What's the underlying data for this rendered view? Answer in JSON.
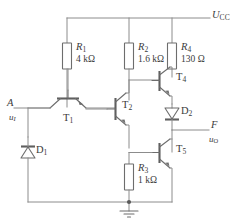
{
  "diagram": {
    "type": "schematic"
  },
  "supply": {
    "label_main": "U",
    "label_sub": "CC"
  },
  "ground": {
    "name": "ground-symbol"
  },
  "resistors": [
    {
      "id": "R1",
      "name": "R",
      "sub": "1",
      "value": "4 kΩ"
    },
    {
      "id": "R2",
      "name": "R",
      "sub": "2",
      "value": "1.6 kΩ"
    },
    {
      "id": "R4",
      "name": "R",
      "sub": "4",
      "value": "130 Ω"
    },
    {
      "id": "R3",
      "name": "R",
      "sub": "3",
      "value": "1 kΩ"
    }
  ],
  "transistors": [
    {
      "id": "T1",
      "name": "T",
      "sub": "1"
    },
    {
      "id": "T2",
      "name": "T",
      "sub": "2"
    },
    {
      "id": "T4",
      "name": "T",
      "sub": "4"
    },
    {
      "id": "T5",
      "name": "T",
      "sub": "5"
    }
  ],
  "diodes": [
    {
      "id": "D1",
      "name": "D",
      "sub": "1"
    },
    {
      "id": "D2",
      "name": "D",
      "sub": "2"
    }
  ],
  "terminals": {
    "input": {
      "node": "A",
      "signal_main": "u",
      "signal_sub": "I"
    },
    "output": {
      "node": "F",
      "signal_main": "u",
      "signal_sub": "O"
    }
  },
  "colors": {
    "wire": "#8c8c8c",
    "device": "#6d6d6d",
    "text": "#3b3b3b",
    "background": "#ffffff"
  }
}
